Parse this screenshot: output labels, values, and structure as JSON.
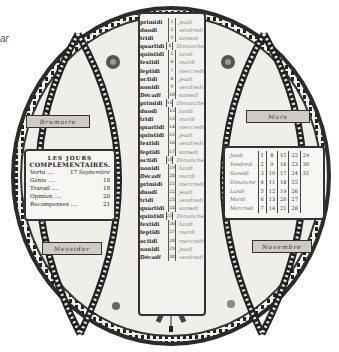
{
  "caption_fragment": "ar",
  "calendar": {
    "title_box": {
      "heading_line1": "LES JOURS",
      "heading_line2": "COMPLEMENTAIRES.",
      "rows": [
        {
          "label": "Vertu",
          "value": "17",
          "note": "Septembre"
        },
        {
          "label": "Génie",
          "value": "18",
          "note": ""
        },
        {
          "label": "Travail",
          "value": "19",
          "note": ""
        },
        {
          "label": "Opinion",
          "value": "20",
          "note": ""
        },
        {
          "label": "Recompenses",
          "value": "21",
          "note": ""
        }
      ]
    },
    "banners": {
      "top_left": "Brumaire",
      "top_right": "Mars",
      "bottom_left": "Messidor",
      "bottom_right": "Novembre"
    },
    "decade_days": [
      {
        "rep": "primidi",
        "num": "1",
        "greg": "jeudi"
      },
      {
        "rep": "duodi",
        "num": "2",
        "greg": "vendredi"
      },
      {
        "rep": "tridi",
        "num": "3",
        "greg": "samedi"
      },
      {
        "rep": "quartidi",
        "num": "4",
        "greg": "Dimanche"
      },
      {
        "rep": "quintidi",
        "num": "5",
        "greg": "lundi"
      },
      {
        "rep": "fextidi",
        "num": "6",
        "greg": "mardi"
      },
      {
        "rep": "feptidi",
        "num": "7",
        "greg": "mercredi"
      },
      {
        "rep": "octidi",
        "num": "8",
        "greg": "jeudi"
      },
      {
        "rep": "nonidi",
        "num": "9",
        "greg": "vendredi"
      },
      {
        "rep": "Décadi",
        "num": "10",
        "greg": "samedi"
      },
      {
        "rep": "primidi",
        "num": "11",
        "greg": "Dimanche"
      },
      {
        "rep": "duodi",
        "num": "12",
        "greg": "lundi"
      },
      {
        "rep": "tridi",
        "num": "13",
        "greg": "mardi"
      },
      {
        "rep": "quartidi",
        "num": "14",
        "greg": "mercredi"
      },
      {
        "rep": "quintidi",
        "num": "15",
        "greg": "jeudi"
      },
      {
        "rep": "fextidi",
        "num": "16",
        "greg": "vendredi"
      },
      {
        "rep": "feptidi",
        "num": "17",
        "greg": "samedi"
      },
      {
        "rep": "octidi",
        "num": "18",
        "greg": "Dimanche"
      },
      {
        "rep": "nonidi",
        "num": "19",
        "greg": "lundi"
      },
      {
        "rep": "Décadi",
        "num": "20",
        "greg": "mardi"
      },
      {
        "rep": "primidi",
        "num": "21",
        "greg": "mercredi"
      },
      {
        "rep": "duodi",
        "num": "22",
        "greg": "jeudi"
      },
      {
        "rep": "tridi",
        "num": "23",
        "greg": "vendredi"
      },
      {
        "rep": "quartidi",
        "num": "24",
        "greg": "samedi"
      },
      {
        "rep": "quintidi",
        "num": "25",
        "greg": "Dimanche"
      },
      {
        "rep": "fextidi",
        "num": "26",
        "greg": "lundi"
      },
      {
        "rep": "feptidi",
        "num": "27",
        "greg": "mardi"
      },
      {
        "rep": "octidi",
        "num": "28",
        "greg": "mercredi"
      },
      {
        "rep": "nonidi",
        "num": "29",
        "greg": "jeudi"
      },
      {
        "rep": "Décadi",
        "num": "30",
        "greg": "vendredi"
      }
    ],
    "month_table": {
      "rows": [
        {
          "day": "Jeudi",
          "dates": [
            "1",
            "8",
            "15",
            "22",
            "29"
          ]
        },
        {
          "day": "Vendredi",
          "dates": [
            "2",
            "9",
            "16",
            "23",
            "30"
          ]
        },
        {
          "day": "Samedi",
          "dates": [
            "3",
            "10",
            "17",
            "24",
            "31"
          ]
        },
        {
          "day": "Dimanche",
          "dates": [
            "4",
            "11",
            "18",
            "25",
            ""
          ]
        },
        {
          "day": "Lundi",
          "dates": [
            "5",
            "12",
            "19",
            "26",
            ""
          ]
        },
        {
          "day": "Mardi",
          "dates": [
            "6",
            "13",
            "20",
            "27",
            ""
          ]
        },
        {
          "day": "Mercredi",
          "dates": [
            "7",
            "14",
            "21",
            "28",
            ""
          ]
        }
      ]
    }
  },
  "colors": {
    "paper": "#f2f1ee",
    "ink": "#2a2a2a",
    "banner": "#cfcac3"
  }
}
